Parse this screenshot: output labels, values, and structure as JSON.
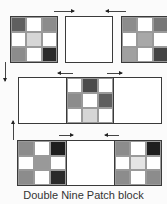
{
  "caption": "Double Nine Patch block",
  "colors": {
    "dark": "#2a2a2a",
    "medium_dark": "#5f5f5f",
    "medium": "#8c8c8c",
    "light": "#d6d6d6",
    "white": "#ffffff"
  },
  "rows": [
    {
      "blocks": [
        {
          "type": "nine-patch",
          "cells": [
            "#5f5f5f",
            "#ffffff",
            "#8c8c8c",
            "#ffffff",
            "#d6d6d6",
            "#ffffff",
            "#8c8c8c",
            "#ffffff",
            "#2a2a2a"
          ]
        },
        {
          "type": "plain"
        },
        {
          "type": "nine-patch",
          "cells": [
            "#8c8c8c",
            "#ffffff",
            "#777777",
            "#ffffff",
            "#a8a8a8",
            "#ffffff",
            "#a0a0a0",
            "#ffffff",
            "#444444"
          ]
        }
      ],
      "arrows": [
        "right",
        "left"
      ]
    },
    {
      "blocks": [
        {
          "type": "plain"
        },
        {
          "type": "nine-patch",
          "cells": [
            "#ffffff",
            "#4a4a4a",
            "#ffffff",
            "#8c8c8c",
            "#ffffff",
            "#5f5f5f",
            "#ffffff",
            "#d6d6d6",
            "#ffffff"
          ]
        },
        {
          "type": "plain"
        }
      ],
      "arrows": [
        "left",
        "right"
      ]
    },
    {
      "blocks": [
        {
          "type": "nine-patch",
          "cells": [
            "#8c8c8c",
            "#ffffff",
            "#1e1e1e",
            "#ffffff",
            "#999999",
            "#ffffff",
            "#8c8c8c",
            "#ffffff",
            "#2a2a2a"
          ]
        },
        {
          "type": "plain"
        },
        {
          "type": "nine-patch",
          "cells": [
            "#8c8c8c",
            "#ffffff",
            "#1e1e1e",
            "#ffffff",
            "#e4e4e4",
            "#ffffff",
            "#8c8c8c",
            "#ffffff",
            "#8c8c8c"
          ]
        }
      ],
      "arrows": [
        "right",
        "left"
      ]
    }
  ],
  "side_arrows": [
    "down",
    "up"
  ]
}
